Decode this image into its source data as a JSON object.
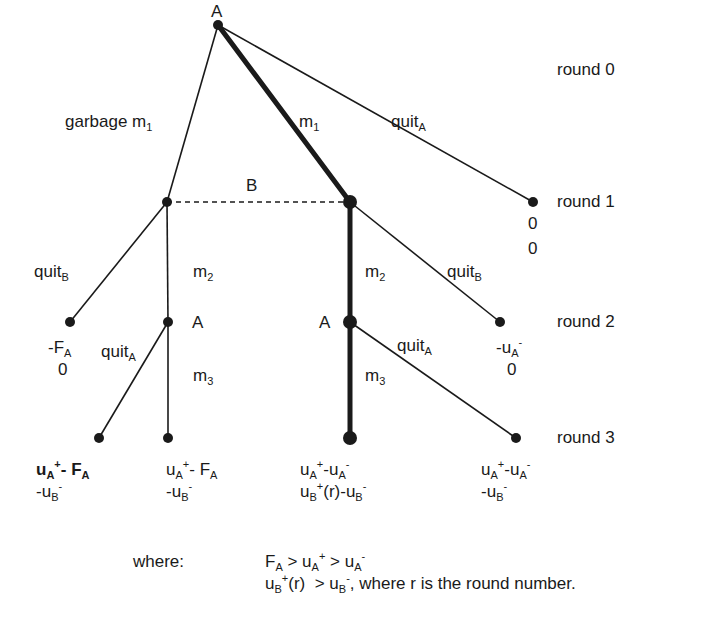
{
  "diagram": {
    "type": "extensive-form game tree",
    "colors": {
      "line": "#1a1a1a",
      "background": "#ffffff"
    },
    "rounds": [
      {
        "label": "round 0"
      },
      {
        "label": "round 1"
      },
      {
        "label": "round 2"
      },
      {
        "label": "round 3"
      }
    ],
    "players": {
      "root": "A",
      "info_set": "B",
      "round2_left": "A",
      "round2_right": "A"
    },
    "edges": {
      "garbage": {
        "text": "garbage m",
        "sub": "1"
      },
      "m1": {
        "text": "m",
        "sub": "1"
      },
      "quitA_root": {
        "text": "quit",
        "sub": "A"
      },
      "quitB_left": {
        "text": "quit",
        "sub": "B"
      },
      "m2_left": {
        "text": "m",
        "sub": "2"
      },
      "m2_right": {
        "text": "m",
        "sub": "2"
      },
      "quitB_right": {
        "text": "quit",
        "sub": "B"
      },
      "quitA_left": {
        "text": "quit",
        "sub": "A"
      },
      "m3_left": {
        "text": "m",
        "sub": "3"
      },
      "quitA_right": {
        "text": "quit",
        "sub": "A"
      },
      "m3_right": {
        "text": "m",
        "sub": "3"
      }
    },
    "payoffs": {
      "round1_quitA": {
        "a": "0",
        "b": "0"
      },
      "round2_quitB_left": {
        "a_pre": "-F",
        "a_sub": "A",
        "b": "0"
      },
      "round2_quitB_right": {
        "a_pre": "-u",
        "a_sub": "A",
        "a_sup": "-",
        "b": "0"
      },
      "round3_1": {
        "a": "u_A^+ - F_A",
        "b": "-u_B^-"
      },
      "round3_2": {
        "a": "u_A^+ - F_A",
        "b": "-u_B^-"
      },
      "round3_3": {
        "a": "u_A^+ - u_A^-",
        "b": "u_B^+(r) - u_B^-"
      },
      "round3_4": {
        "a": "u_A^+ - u_A^-",
        "b": "-u_B^-"
      }
    },
    "footnote": {
      "label": "where:",
      "line1": "F_A > u_A^+ > u_A^-",
      "line2_tail": ", where r is the round number."
    }
  }
}
